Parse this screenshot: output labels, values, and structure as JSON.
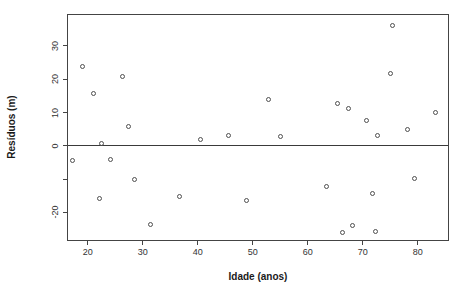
{
  "chart_data": {
    "type": "scatter",
    "title": "",
    "xlabel": "Idade (anos)",
    "ylabel": "Resíduos (m)",
    "xlim": [
      16.2,
      85.7
    ],
    "ylim": [
      -28.6,
      39.6
    ],
    "x_ticks": [
      20,
      30,
      40,
      50,
      60,
      70,
      80
    ],
    "x_tick_labels": [
      "20",
      "30",
      "40",
      "50",
      "60",
      "70",
      "80"
    ],
    "y_ticks": [
      30,
      20,
      10,
      0,
      -10,
      -20
    ],
    "y_tick_labels": [
      "30",
      "20",
      "10",
      "0",
      "",
      "-20"
    ],
    "reference_line_y": 0,
    "grid": false,
    "legend": null,
    "marker": "open-circle",
    "points": [
      {
        "x": 17.2,
        "y": -4.5
      },
      {
        "x": 19.1,
        "y": 23.8
      },
      {
        "x": 21.0,
        "y": 15.6
      },
      {
        "x": 22.2,
        "y": -15.9
      },
      {
        "x": 22.4,
        "y": 0.6
      },
      {
        "x": 24.2,
        "y": -4.1
      },
      {
        "x": 26.3,
        "y": 20.8
      },
      {
        "x": 27.3,
        "y": 5.7
      },
      {
        "x": 28.4,
        "y": -10.1
      },
      {
        "x": 31.4,
        "y": -23.7
      },
      {
        "x": 36.6,
        "y": -15.2
      },
      {
        "x": 40.5,
        "y": 2.0
      },
      {
        "x": 45.6,
        "y": 3.2
      },
      {
        "x": 48.8,
        "y": -16.3
      },
      {
        "x": 52.9,
        "y": 14.0
      },
      {
        "x": 55.1,
        "y": 2.8
      },
      {
        "x": 63.4,
        "y": -12.1
      },
      {
        "x": 65.4,
        "y": 12.7
      },
      {
        "x": 66.4,
        "y": -26.0
      },
      {
        "x": 67.5,
        "y": 11.2
      },
      {
        "x": 68.1,
        "y": -23.8
      },
      {
        "x": 70.6,
        "y": 7.7
      },
      {
        "x": 71.7,
        "y": -14.3
      },
      {
        "x": 72.4,
        "y": -25.7
      },
      {
        "x": 72.7,
        "y": 3.1
      },
      {
        "x": 75.0,
        "y": 21.8
      },
      {
        "x": 75.5,
        "y": 36.0
      },
      {
        "x": 78.1,
        "y": 4.9
      },
      {
        "x": 79.4,
        "y": -9.7
      },
      {
        "x": 83.3,
        "y": 9.9
      }
    ],
    "colors": {
      "marker": "#4f4f4f",
      "axis": "#444444",
      "text": "#1a1a1a",
      "background": "#ffffff"
    }
  }
}
